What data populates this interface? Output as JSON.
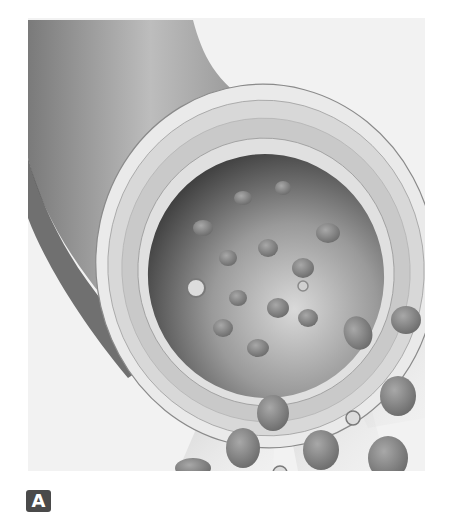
{
  "figure": {
    "panel_label": "A",
    "colors": {
      "background": "#ffffff",
      "frame_bg": "#f2f2f2",
      "vessel_dark": "#5a5a5a",
      "vessel_light": "#b8b8b8",
      "wall": "#e6e6e6",
      "lumen_dark": "#3a3a3a",
      "cell": "#8a8a8a",
      "label_bg": "#4a4a4a",
      "label_text": "#ffffff"
    }
  }
}
